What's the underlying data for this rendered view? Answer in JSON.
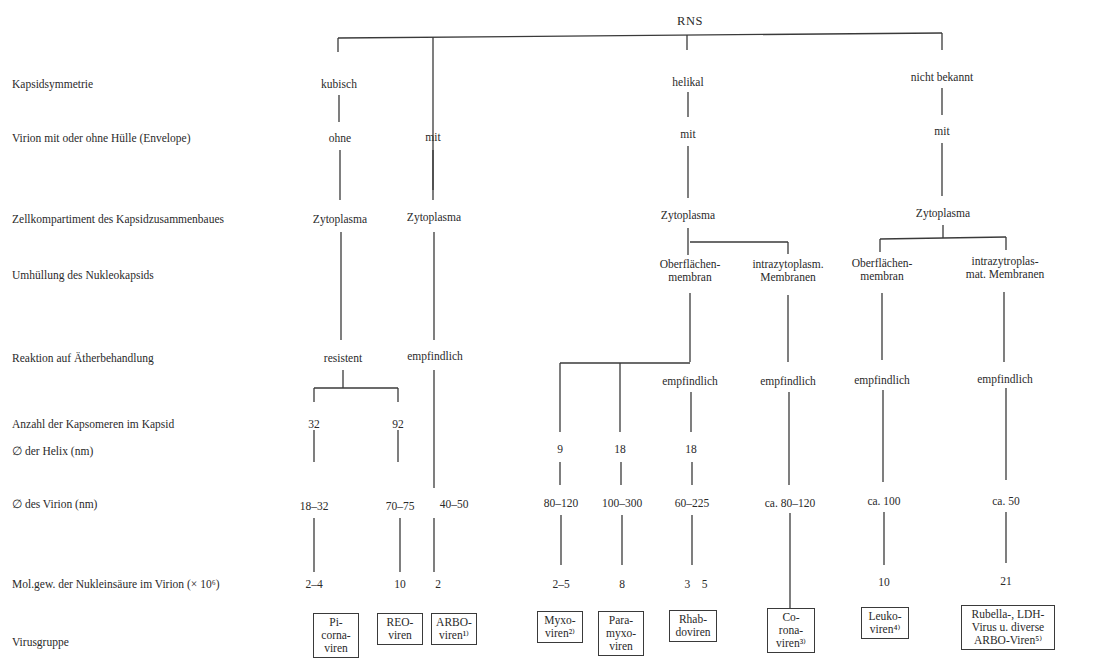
{
  "caption": "",
  "root": "RNS",
  "row_labels": [
    "Kapsidsymmetrie",
    "Virion mit oder ohne Hülle (Envelope)",
    "Zellkompartiment des Kapsidzusammenbaues",
    "Umhüllung des Nukleokapsids",
    "Reaktion auf Ätherbehandlung",
    "Anzahl der Kapsomeren im Kapsid",
    "∅ der Helix (nm)",
    "∅ des Virion (nm)",
    "Mol.gew. der Nukleinsäure im Virion (× 10⁶)",
    "Virusgruppe"
  ],
  "symmetry": {
    "kubisch": "kubisch",
    "helikal": "helikal",
    "unknown": "nicht bekannt"
  },
  "envelope": {
    "ohne": "ohne",
    "mit_arbo": "mit",
    "mit_helikal": "mit",
    "mit_unknown": "mit"
  },
  "compartment": {
    "picorna_reo": "Zytoplasma",
    "arbo": "Zytoplasma",
    "helikal": "Zytoplasma",
    "unknown": "Zytoplasma"
  },
  "enveloping": {
    "helikal_surface": "Oberflächen-\nmembran",
    "helikal_intra": "intrazytoplasm.\nMembranen",
    "unknown_surface": "Oberflächen-\nmembran",
    "unknown_intra": "intrazytroplas-\nmat. Membranen"
  },
  "ether": {
    "picorna_reo": "resistent",
    "arbo": "empfindlich",
    "rhabdo": "empfindlich",
    "corona": "empfindlich",
    "leuko": "empfindlich",
    "rubella": "empfindlich"
  },
  "capsomeres": {
    "picorna": "32",
    "reo": "92"
  },
  "helix": {
    "myxo": "9",
    "paramyxo": "18",
    "rhabdo": "18"
  },
  "virion_diameter": {
    "picorna": "18–32",
    "reo": "70–75",
    "arbo": "40–50",
    "myxo": "80–120",
    "paramyxo": "100–300",
    "rhabdo": "60–225",
    "corona": "ca. 80–120",
    "leuko": "ca. 100",
    "rubella": "ca. 50"
  },
  "molweight": {
    "picorna": "2–4",
    "reo": "10",
    "arbo": "2",
    "myxo": "2–5",
    "paramyxo": "8",
    "rhabdo": "3    5",
    "leuko": "10",
    "rubella": "21"
  },
  "groups": {
    "picorna": "Pi-\ncorna-\nviren",
    "reo": "REO-\nviren",
    "arbo": "ARBO-\nviren¹⁾",
    "myxo": "Myxo-\nviren²⁾",
    "paramyxo": "Para-\nmyxo-\nviren",
    "rhabdo": "Rhab-\ndoviren",
    "corona": "Co-\nrona-\nviren³⁾",
    "leuko": "Leuko-\nviren⁴⁾",
    "rubella": "Rubella-, LDH-\nVirus u. diverse\nARBO-Viren⁵⁾"
  }
}
